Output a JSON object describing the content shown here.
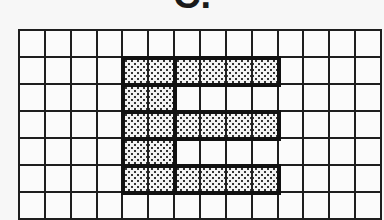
{
  "title": "C.",
  "grid": {
    "columns": 14,
    "rows": 7,
    "filled_cells": [
      [
        1,
        4
      ],
      [
        1,
        5
      ],
      [
        1,
        6
      ],
      [
        1,
        7
      ],
      [
        1,
        8
      ],
      [
        1,
        9
      ],
      [
        2,
        4
      ],
      [
        2,
        5
      ],
      [
        3,
        4
      ],
      [
        3,
        5
      ],
      [
        3,
        6
      ],
      [
        3,
        7
      ],
      [
        3,
        8
      ],
      [
        3,
        9
      ],
      [
        4,
        4
      ],
      [
        4,
        5
      ],
      [
        5,
        4
      ],
      [
        5,
        5
      ],
      [
        5,
        6
      ],
      [
        5,
        7
      ],
      [
        5,
        8
      ],
      [
        5,
        9
      ]
    ],
    "shape": "letter-E",
    "fill_pattern": "dotted",
    "line_color": "#1e1e1e"
  }
}
